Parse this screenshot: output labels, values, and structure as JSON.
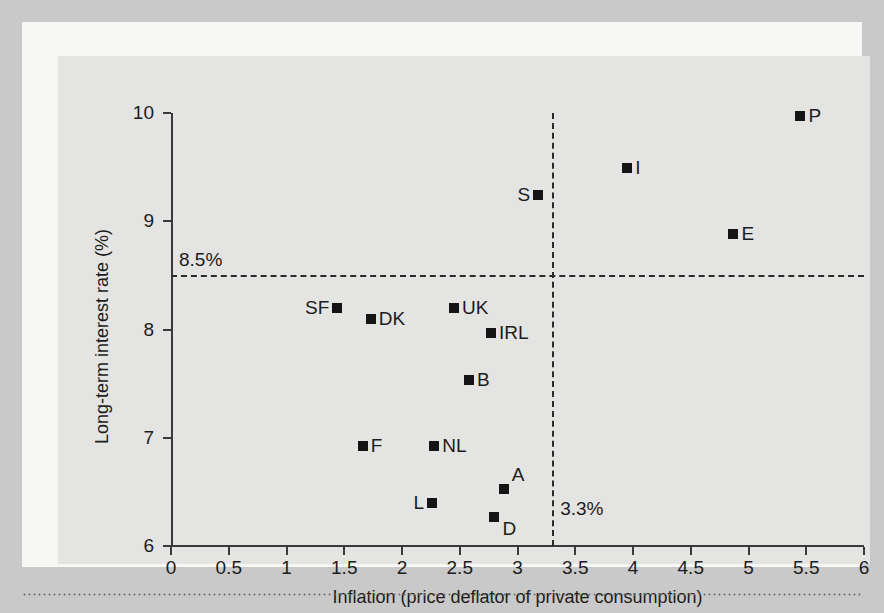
{
  "chart_data": {
    "type": "scatter",
    "title": "",
    "xlabel": "Inflation (price deflator of private consumption)",
    "ylabel": "Long-term interest rate (%)",
    "xlim": [
      0,
      6
    ],
    "ylim": [
      6,
      10
    ],
    "xticks": [
      "0",
      "0.5",
      "1",
      "1.5",
      "2",
      "2.5",
      "3",
      "3.5",
      "4",
      "4.5",
      "5",
      "5.5",
      "6"
    ],
    "xtick_values": [
      0,
      0.5,
      1,
      1.5,
      2,
      2.5,
      3,
      3.5,
      4,
      4.5,
      5,
      5.5,
      6
    ],
    "yticks": [
      "6",
      "7",
      "8",
      "9",
      "10"
    ],
    "ytick_values": [
      6,
      7,
      8,
      9,
      10
    ],
    "grid": false,
    "legend": null,
    "marker": "filled-square",
    "marker_color": "#141414",
    "reference_lines": [
      {
        "name": "interest-rate-criterion",
        "orientation": "horizontal",
        "value": 8.5,
        "label": "8.5%",
        "style": "dashed"
      },
      {
        "name": "inflation-criterion",
        "orientation": "vertical",
        "value": 3.3,
        "label": "3.3%",
        "style": "dashed"
      }
    ],
    "points": [
      {
        "label": "P",
        "x": 5.45,
        "y": 9.97,
        "label_pos": "right"
      },
      {
        "label": "I",
        "x": 3.95,
        "y": 9.49,
        "label_pos": "right"
      },
      {
        "label": "S",
        "x": 3.18,
        "y": 9.24,
        "label_pos": "left"
      },
      {
        "label": "E",
        "x": 4.87,
        "y": 8.88,
        "label_pos": "right"
      },
      {
        "label": "SF",
        "x": 1.44,
        "y": 8.2,
        "label_pos": "left"
      },
      {
        "label": "UK",
        "x": 2.45,
        "y": 8.2,
        "label_pos": "right"
      },
      {
        "label": "DK",
        "x": 1.73,
        "y": 8.1,
        "label_pos": "right"
      },
      {
        "label": "IRL",
        "x": 2.77,
        "y": 7.97,
        "label_pos": "right"
      },
      {
        "label": "B",
        "x": 2.58,
        "y": 7.53,
        "label_pos": "right"
      },
      {
        "label": "F",
        "x": 1.66,
        "y": 6.92,
        "label_pos": "right"
      },
      {
        "label": "NL",
        "x": 2.28,
        "y": 6.92,
        "label_pos": "right"
      },
      {
        "label": "A",
        "x": 2.88,
        "y": 6.53,
        "label_pos": "upper-right"
      },
      {
        "label": "L",
        "x": 2.26,
        "y": 6.4,
        "label_pos": "left"
      },
      {
        "label": "D",
        "x": 2.8,
        "y": 6.27,
        "label_pos": "lower-right"
      }
    ]
  },
  "colors": {
    "figure_border": "#c9c9c9",
    "mat": "#f7f7f5",
    "plot_background": "#e4e4e2",
    "axis": "#3a3a3a",
    "text": "#1c1c1c",
    "marker": "#141414"
  }
}
